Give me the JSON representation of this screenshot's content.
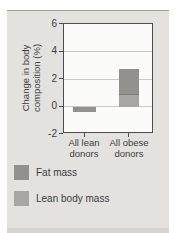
{
  "figure": {
    "ylabel_lines": [
      "Change in body",
      "composition (%)"
    ]
  },
  "chart_data": {
    "type": "bar",
    "stacked": true,
    "title": "",
    "xlabel": "",
    "ylabel": "Change in body composition (%)",
    "categories": [
      "All lean donors",
      "All obese donors"
    ],
    "series": [
      {
        "name": "Fat mass",
        "values": [
          -0.4,
          1.8
        ],
        "color": "#93918d"
      },
      {
        "name": "Lean body mass",
        "values": [
          0,
          0.9
        ],
        "color": "#a8a6a2"
      }
    ],
    "ylim": [
      -2,
      6
    ],
    "yticks": [
      6,
      4,
      2,
      0,
      -2
    ],
    "ytick_labels": [
      "6",
      "4",
      "2",
      "0",
      "-2"
    ],
    "gridlines_at": [
      4,
      2,
      0
    ],
    "grid": true,
    "legend_position": "bottom-left",
    "colors": {
      "panel_bg": "#e3e2df",
      "plot_bg": "#fbfbfa",
      "axis": "#4d4d4b",
      "grid": "#cac9c5",
      "divider": "#7d7b77",
      "text": "#3c3c3c"
    }
  }
}
